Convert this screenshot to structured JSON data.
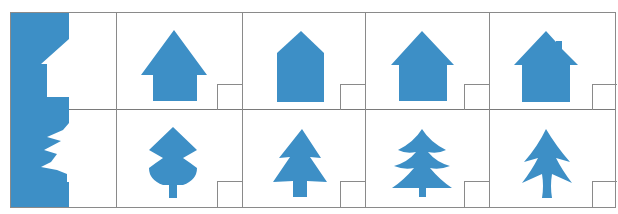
{
  "worksheet": {
    "fill_color": "#3d8fc6",
    "rows": [
      {
        "name": "house",
        "sample": "house-half-silhouette",
        "options": [
          {
            "index": 1,
            "shape": "house-wide-roof"
          },
          {
            "index": 2,
            "shape": "house-pentagon"
          },
          {
            "index": 3,
            "shape": "house-eaves"
          },
          {
            "index": 4,
            "shape": "house-with-chimney"
          }
        ]
      },
      {
        "name": "tree",
        "sample": "tree-half-silhouette",
        "options": [
          {
            "index": 1,
            "shape": "tree-rounded-two-tier"
          },
          {
            "index": 2,
            "shape": "tree-two-tier-pointed"
          },
          {
            "index": 3,
            "shape": "tree-three-tier-curved"
          },
          {
            "index": 4,
            "shape": "tree-two-tier-spiky"
          }
        ]
      }
    ],
    "answer_boxes": [
      "",
      "",
      "",
      "",
      "",
      "",
      "",
      ""
    ]
  }
}
